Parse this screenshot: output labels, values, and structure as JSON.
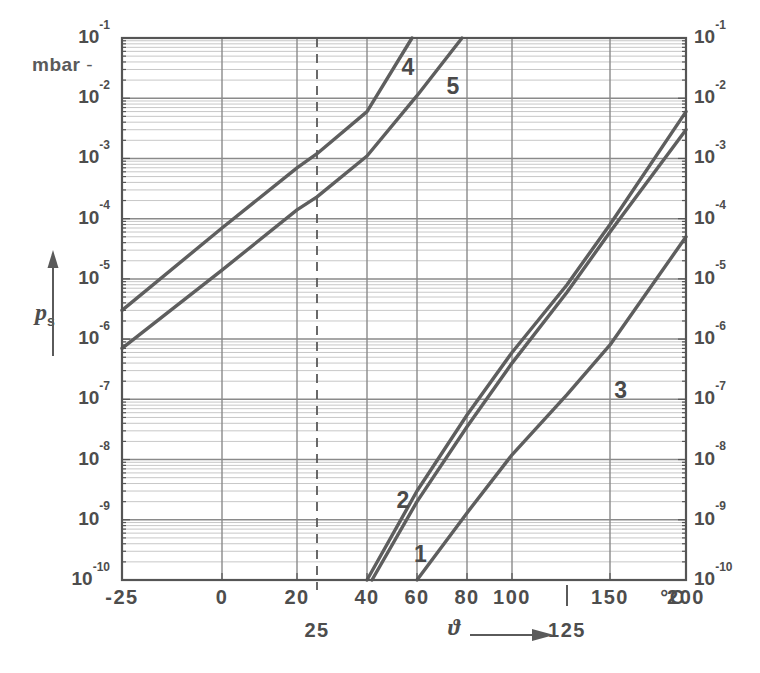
{
  "axis": {
    "y_unit": "mbar",
    "y_symbol_p": "p",
    "y_symbol_sub": "s",
    "x_symbol": "ϑ",
    "x_unit": "°C",
    "y_ticks_left": [
      "-1",
      "-2",
      "-3",
      "-4",
      "-5",
      "-6",
      "-7",
      "-8",
      "-9",
      "-10"
    ],
    "y_ticks_right": [
      "-1",
      "-2",
      "-3",
      "-4",
      "-5",
      "-6",
      "-7",
      "-8",
      "-9",
      "-10"
    ],
    "y_tick_mantissa": "10",
    "x_ticks": [
      "-25",
      "0",
      "20",
      "40",
      "60",
      "80",
      "100",
      "150",
      "200"
    ],
    "x_annotation_25": "25",
    "x_annotation_125": "125"
  },
  "curves": {
    "labels": [
      "1",
      "2",
      "3",
      "4",
      "5"
    ]
  },
  "colors": {
    "ink": "#4a4a4a",
    "grid_major": "#8a8a8a",
    "grid_minor": "#b9b9b9",
    "curve": "#5e5e5e",
    "background": "#ffffff"
  },
  "chart_data": {
    "type": "line",
    "title": "",
    "subtitle": "",
    "xlabel": "ϑ",
    "ylabel": "p_s",
    "x_unit": "°C",
    "y_unit": "mbar",
    "yscale": "log",
    "xscale": "reciprocal-temperature",
    "grid": true,
    "legend": "inline-curve-numbers",
    "xlim": [
      -25,
      200
    ],
    "ylim": [
      1e-10,
      0.1
    ],
    "x_tick_values": [
      -25,
      0,
      20,
      40,
      60,
      80,
      100,
      150,
      200
    ],
    "x_tick_labels": [
      "-25",
      "0",
      "20",
      "40",
      "60",
      "80",
      "100",
      "150",
      "200"
    ],
    "x_extra_marks": [
      {
        "value": 25,
        "label": "25",
        "style": "dashed-vertical-full-height"
      },
      {
        "value": 125,
        "label": "125",
        "style": "short-tick-below-axis"
      }
    ],
    "y_tick_values": [
      0.1,
      0.01,
      0.001,
      0.0001,
      1e-05,
      1e-06,
      1e-07,
      1e-08,
      1e-09,
      1e-10
    ],
    "y_tick_labels": [
      "10^-1",
      "10^-2",
      "10^-3",
      "10^-4",
      "10^-5",
      "10^-6",
      "10^-7",
      "10^-8",
      "10^-9",
      "10^-10"
    ],
    "y_minor_ticks": "log decades subdivided 2-9",
    "series": [
      {
        "name": "1",
        "label_position": {
          "x": 62,
          "y": 2.5e-10
        },
        "points": [
          {
            "x": 42,
            "y": 1e-10
          },
          {
            "x": 60,
            "y": 2e-09
          },
          {
            "x": 80,
            "y": 3.5e-08
          },
          {
            "x": 100,
            "y": 4e-07
          },
          {
            "x": 125,
            "y": 6e-06
          },
          {
            "x": 150,
            "y": 6e-05
          },
          {
            "x": 200,
            "y": 0.003
          }
        ]
      },
      {
        "name": "2",
        "label_position": {
          "x": 55,
          "y": 2e-09
        },
        "points": [
          {
            "x": 40,
            "y": 1e-10
          },
          {
            "x": 60,
            "y": 3e-09
          },
          {
            "x": 80,
            "y": 5.5e-08
          },
          {
            "x": 100,
            "y": 6e-07
          },
          {
            "x": 125,
            "y": 8e-06
          },
          {
            "x": 150,
            "y": 8e-05
          },
          {
            "x": 200,
            "y": 0.006
          }
        ]
      },
      {
        "name": "3",
        "label_position": {
          "x": 158,
          "y": 1.3e-07
        },
        "points": [
          {
            "x": 60,
            "y": 1e-10
          },
          {
            "x": 80,
            "y": 1.3e-09
          },
          {
            "x": 100,
            "y": 1.2e-08
          },
          {
            "x": 125,
            "y": 1.2e-07
          },
          {
            "x": 150,
            "y": 8e-07
          },
          {
            "x": 200,
            "y": 5e-05
          }
        ]
      },
      {
        "name": "4",
        "label_position": {
          "x": 57,
          "y": 0.03
        },
        "points": [
          {
            "x": -25,
            "y": 3e-06
          },
          {
            "x": 0,
            "y": 7e-05
          },
          {
            "x": 20,
            "y": 0.0007
          },
          {
            "x": 25,
            "y": 0.0012
          },
          {
            "x": 40,
            "y": 0.006
          },
          {
            "x": 58,
            "y": 0.1
          }
        ]
      },
      {
        "name": "5",
        "label_position": {
          "x": 75,
          "y": 0.015
        },
        "points": [
          {
            "x": -25,
            "y": 7e-07
          },
          {
            "x": 0,
            "y": 1.4e-05
          },
          {
            "x": 20,
            "y": 0.00014
          },
          {
            "x": 25,
            "y": 0.00023
          },
          {
            "x": 40,
            "y": 0.0011
          },
          {
            "x": 60,
            "y": 0.011
          },
          {
            "x": 78,
            "y": 0.1
          }
        ]
      }
    ]
  }
}
